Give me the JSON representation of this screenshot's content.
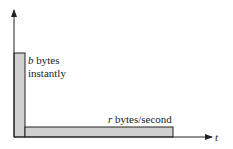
{
  "diagram": {
    "burst_label": {
      "var": "b",
      "text": " bytes",
      "line2": "instantly"
    },
    "rate_label": {
      "var": "r",
      "text": " bytes/second"
    },
    "x_axis_label": "t",
    "colors": {
      "bar_fill": "#d0d0d0",
      "stroke": "#222222"
    }
  }
}
